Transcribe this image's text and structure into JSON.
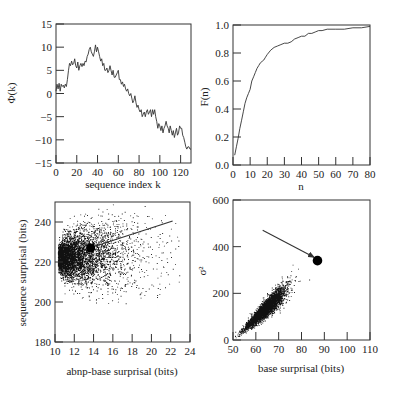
{
  "figure": {
    "panels": [
      "top-left",
      "top-right",
      "bottom-left",
      "bottom-right"
    ]
  },
  "chart_data": [
    {
      "id": "phi",
      "type": "line",
      "title": "",
      "xlabel": "sequence index k",
      "ylabel": "Φ(k)",
      "xlim": [
        0,
        130
      ],
      "ylim": [
        -15,
        15
      ],
      "xticks": [
        0,
        20,
        40,
        60,
        80,
        100,
        120
      ],
      "yticks": [
        -15,
        -10,
        -5,
        0,
        5,
        10,
        15
      ],
      "grid": false,
      "x": [
        0,
        1,
        2,
        3,
        4,
        5,
        6,
        7,
        8,
        9,
        10,
        11,
        12,
        13,
        14,
        15,
        16,
        17,
        18,
        19,
        20,
        21,
        22,
        23,
        24,
        25,
        26,
        27,
        28,
        29,
        30,
        31,
        32,
        33,
        34,
        35,
        36,
        37,
        38,
        39,
        40,
        41,
        42,
        43,
        44,
        45,
        46,
        47,
        48,
        49,
        50,
        51,
        52,
        53,
        54,
        55,
        56,
        57,
        58,
        59,
        60,
        61,
        62,
        63,
        64,
        65,
        66,
        67,
        68,
        69,
        70,
        71,
        72,
        73,
        74,
        75,
        76,
        77,
        78,
        79,
        80,
        81,
        82,
        83,
        84,
        85,
        86,
        87,
        88,
        89,
        90,
        91,
        92,
        93,
        94,
        95,
        96,
        97,
        98,
        99,
        100,
        101,
        102,
        103,
        104,
        105,
        106,
        107,
        108,
        109,
        110,
        111,
        112,
        113,
        114,
        115,
        116,
        117,
        118,
        119,
        120,
        121,
        122,
        123,
        124,
        125,
        126,
        127,
        128,
        129,
        130
      ],
      "values": [
        0.5,
        2,
        1,
        2.2,
        0.5,
        2,
        1.5,
        1.8,
        1.2,
        2,
        1.5,
        3,
        5,
        6.5,
        6,
        7,
        6.2,
        6.5,
        7.5,
        6,
        5.5,
        6.8,
        5,
        6,
        6.5,
        5.8,
        6.5,
        6,
        7,
        6.8,
        8,
        8.5,
        9.5,
        10,
        9,
        8.5,
        8,
        9,
        10.5,
        9,
        10,
        9,
        8,
        7,
        7.5,
        6,
        6.5,
        5,
        5,
        5.5,
        4.5,
        5,
        6,
        5,
        4,
        5,
        3.5,
        3.5,
        4,
        4.5,
        5,
        3,
        3,
        2,
        2.5,
        1.5,
        2,
        1,
        0.5,
        1,
        0,
        -0.5,
        0,
        -1,
        -2,
        -1.5,
        -0.5,
        -2,
        -3,
        -2.5,
        -3.5,
        -4,
        -3.5,
        -5,
        -4.5,
        -4,
        -5,
        -4,
        -3.5,
        -4.5,
        -4,
        -3.5,
        -5,
        -3.5,
        -4.5,
        -3.5,
        -5,
        -6,
        -7.5,
        -6.5,
        -7,
        -8,
        -7,
        -8.5,
        -7.5,
        -7,
        -6,
        -7,
        -7.5,
        -8.5,
        -7,
        -8,
        -9,
        -8,
        -9.5,
        -8.5,
        -7.5,
        -9,
        -8.5,
        -7,
        -7.5,
        -7.5,
        -9,
        -9.5,
        -10.5,
        -11.5,
        -12,
        -11.5,
        -11.5,
        -12,
        -12
      ]
    },
    {
      "id": "cdf",
      "type": "line",
      "title": "",
      "xlabel": "n",
      "ylabel": "F(n)",
      "xlim": [
        0,
        80
      ],
      "ylim": [
        0.0,
        1.0
      ],
      "xticks": [
        0,
        10,
        20,
        30,
        40,
        50,
        60,
        70,
        80
      ],
      "yticks": [
        0.0,
        0.2,
        0.4,
        0.6,
        0.8,
        1.0
      ],
      "ytick_labels": [
        "0.0",
        "0.2",
        "0.4",
        "0.6",
        "0.8",
        "1.0"
      ],
      "grid": false,
      "x": [
        1,
        2,
        3,
        4,
        5,
        6,
        7,
        8,
        9,
        10,
        11,
        12,
        13,
        14,
        15,
        16,
        17,
        18,
        19,
        20,
        22,
        24,
        26,
        28,
        30,
        32,
        34,
        36,
        38,
        40,
        42,
        44,
        46,
        48,
        50,
        52,
        55,
        60,
        65,
        70,
        75,
        80
      ],
      "values": [
        0.07,
        0.13,
        0.19,
        0.26,
        0.32,
        0.38,
        0.44,
        0.48,
        0.51,
        0.54,
        0.6,
        0.63,
        0.66,
        0.69,
        0.71,
        0.73,
        0.74,
        0.75,
        0.77,
        0.79,
        0.82,
        0.84,
        0.85,
        0.86,
        0.87,
        0.87,
        0.88,
        0.9,
        0.91,
        0.92,
        0.92,
        0.94,
        0.94,
        0.95,
        0.96,
        0.96,
        0.97,
        0.97,
        0.97,
        0.98,
        0.98,
        0.99
      ]
    },
    {
      "id": "abnp-scatter",
      "type": "scatter",
      "title": "",
      "xlabel": "abnp-base surprisal (bits)",
      "ylabel": "sequence surprisal (bits)",
      "xlim": [
        10,
        24
      ],
      "ylim": [
        180,
        250
      ],
      "xticks": [
        10,
        12,
        14,
        16,
        18,
        20,
        22,
        24
      ],
      "yticks": [
        180,
        200,
        220,
        240
      ],
      "grid": false,
      "cloud": {
        "n": 5000,
        "x_min": 10.3,
        "y_center": 222,
        "y_spread_base": 4,
        "y_spread_growth": 5.5,
        "density_decay": 0.42,
        "seed": 7
      },
      "highlight": {
        "x": 13.7,
        "y": 227,
        "label": ""
      },
      "annotation_line": {
        "from": [
          13.9,
          227.5
        ],
        "to": [
          22.2,
          240.5
        ]
      }
    },
    {
      "id": "sigma-scatter",
      "type": "scatter",
      "title": "",
      "xlabel": "base surprisal (bits)",
      "ylabel": "σ²",
      "xlim": [
        50,
        110
      ],
      "ylim": [
        0,
        600
      ],
      "xticks": [
        50,
        60,
        70,
        80,
        90,
        100,
        110
      ],
      "yticks": [
        0,
        200,
        400,
        600
      ],
      "grid": false,
      "cloud": {
        "n": 4000,
        "x_center": 64,
        "x_sd": 4.2,
        "slope": 9.2,
        "intercept": -455,
        "noise_sd": 7,
        "seed": 11
      },
      "highlight": {
        "x": 87,
        "y": 340,
        "label": ""
      },
      "annotation_arrow": {
        "from": [
          63,
          470
        ],
        "to": [
          85.5,
          355
        ]
      }
    }
  ]
}
